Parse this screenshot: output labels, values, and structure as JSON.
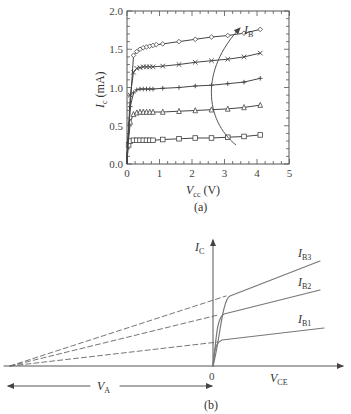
{
  "figure": {
    "panel_a": {
      "caption": "(a)",
      "ylabel_main": "I",
      "ylabel_sub": "c",
      "ylabel_unit": " (mA)",
      "xlabel_main": "V",
      "xlabel_sub": "cc",
      "xlabel_unit": " (V)",
      "arrow_label_main": "I",
      "arrow_label_sub": "B",
      "yticks": [
        "0.0",
        "0.5",
        "1.0",
        "1.5",
        "2.0"
      ],
      "xticks": [
        "0",
        "1",
        "2",
        "3",
        "4",
        "5"
      ]
    },
    "panel_b": {
      "caption": "(b)",
      "ylabel_main": "I",
      "ylabel_sub": "C",
      "xlabel_main": "V",
      "xlabel_sub": "CE",
      "origin_label": "0",
      "va_label_main": "V",
      "va_label_sub": "A",
      "curves": [
        {
          "main": "I",
          "sub": "B3"
        },
        {
          "main": "I",
          "sub": "B2"
        },
        {
          "main": "I",
          "sub": "B1"
        }
      ]
    }
  },
  "chart_data": [
    {
      "type": "line",
      "title": "(a)",
      "xlabel": "V_cc (V)",
      "ylabel": "I_c (mA)",
      "xlim": [
        0,
        5
      ],
      "ylim": [
        0,
        2.0
      ],
      "grid": false,
      "annotation": "I_B increasing (arrow upward)",
      "series": [
        {
          "name": "I_B1 (squares)",
          "marker": "square",
          "x": [
            0.0,
            0.05,
            0.1,
            0.2,
            0.3,
            0.4,
            0.5,
            0.6,
            0.7,
            0.8,
            1.1,
            1.6,
            2.1,
            2.6,
            3.1,
            3.6,
            4.1
          ],
          "y": [
            0.05,
            0.25,
            0.3,
            0.31,
            0.31,
            0.31,
            0.31,
            0.31,
            0.31,
            0.31,
            0.32,
            0.33,
            0.34,
            0.34,
            0.35,
            0.36,
            0.38
          ]
        },
        {
          "name": "I_B2 (triangles)",
          "marker": "triangle",
          "x": [
            0.0,
            0.1,
            0.2,
            0.3,
            0.4,
            0.5,
            0.6,
            0.7,
            0.8,
            1.1,
            1.6,
            2.1,
            2.6,
            3.1,
            3.6,
            4.1
          ],
          "y": [
            0.1,
            0.55,
            0.65,
            0.67,
            0.68,
            0.68,
            0.68,
            0.68,
            0.68,
            0.68,
            0.69,
            0.7,
            0.71,
            0.72,
            0.74,
            0.77
          ]
        },
        {
          "name": "I_B3 (plus)",
          "marker": "plus",
          "x": [
            0.0,
            0.1,
            0.2,
            0.3,
            0.4,
            0.5,
            0.6,
            0.7,
            0.8,
            1.1,
            1.6,
            2.1,
            2.6,
            3.1,
            3.6,
            4.1
          ],
          "y": [
            0.1,
            0.75,
            0.93,
            0.97,
            0.98,
            0.98,
            0.98,
            0.98,
            0.98,
            0.99,
            1.0,
            1.02,
            1.03,
            1.05,
            1.07,
            1.12
          ]
        },
        {
          "name": "I_B4 (crosses)",
          "marker": "x",
          "x": [
            0.0,
            0.1,
            0.2,
            0.3,
            0.4,
            0.5,
            0.6,
            0.7,
            0.8,
            1.1,
            1.6,
            2.1,
            2.6,
            3.1,
            3.6,
            4.1
          ],
          "y": [
            0.1,
            0.9,
            1.2,
            1.25,
            1.26,
            1.27,
            1.27,
            1.27,
            1.27,
            1.28,
            1.3,
            1.33,
            1.35,
            1.37,
            1.4,
            1.45
          ]
        },
        {
          "name": "I_B5 (diamonds)",
          "marker": "diamond",
          "x": [
            0.0,
            0.2,
            0.3,
            0.4,
            0.5,
            0.6,
            0.7,
            0.8,
            0.9,
            1.1,
            1.6,
            2.1,
            2.6,
            3.1,
            3.6,
            4.1
          ],
          "y": [
            0.1,
            1.42,
            1.47,
            1.5,
            1.52,
            1.53,
            1.54,
            1.55,
            1.56,
            1.57,
            1.6,
            1.63,
            1.66,
            1.68,
            1.71,
            1.76
          ]
        }
      ]
    },
    {
      "type": "line",
      "title": "(b)",
      "xlabel": "V_CE",
      "ylabel": "I_C",
      "description": "Schematic output characteristics showing Early effect; dashed extrapolations of the saturation-region lines converge at -V_A on the V_CE axis",
      "series": [
        {
          "name": "I_B1",
          "style": "solid+dashed extrapolation"
        },
        {
          "name": "I_B2",
          "style": "solid+dashed extrapolation"
        },
        {
          "name": "I_B3",
          "style": "solid+dashed extrapolation"
        }
      ],
      "annotations": [
        "0",
        "V_A"
      ]
    }
  ]
}
